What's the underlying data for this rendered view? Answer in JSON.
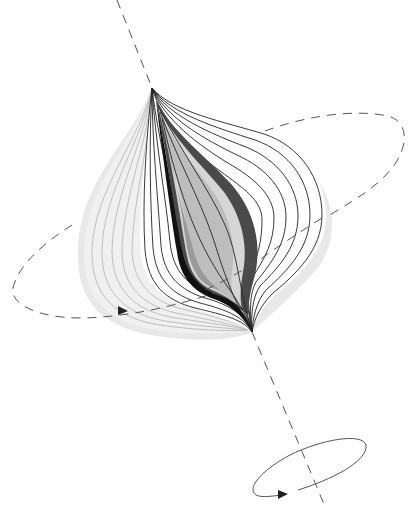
{
  "figure": {
    "colors": {
      "background": "#ffffff",
      "halo": "#e6e6e6",
      "back_surface": "#efefef",
      "front_surface": "#ffffff",
      "dark_band": "#4a4a4a",
      "core_light": "#c8c8c8",
      "core_mid": "#a6a6a6",
      "core_pale": "#d9d9d9",
      "line": "#222222",
      "dash": "#555555"
    },
    "axis": {
      "style": "dashed",
      "from": [
        117,
        0
      ],
      "to": [
        326,
        509
      ]
    },
    "upper_orbit": {
      "style": "dashed",
      "direction": "counterclockwise"
    },
    "rotation_indicator": {
      "style": "solid",
      "arrow": true
    }
  }
}
